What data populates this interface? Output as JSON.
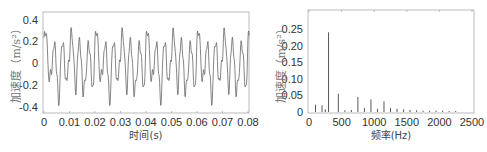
{
  "chart_data": [
    {
      "type": "line",
      "title": "",
      "xlabel": "时间(s)",
      "ylabel": "加速度（m/s²）",
      "xlim": [
        0,
        0.08
      ],
      "ylim": [
        -0.45,
        0.45
      ],
      "xticks": [
        "0",
        "0.01",
        "0.02",
        "0.03",
        "0.04",
        "0.05",
        "0.06",
        "0.07",
        "0.08"
      ],
      "yticks": [
        "0.4",
        "0.2",
        "0",
        "-0.2",
        "-0.4"
      ],
      "grid": false,
      "legend": null,
      "series": [
        {
          "name": "acceleration time signal",
          "description": "periodic multi-tone vibration signal, dominant ~300 Hz with harmonics; amplitude approx -0.37 to 0.36",
          "components_hz": [
            100,
            300,
            450,
            750
          ],
          "amplitudes": [
            0.03,
            0.24,
            0.055,
            0.045
          ]
        }
      ]
    },
    {
      "type": "bar",
      "title": "",
      "xlabel": "频率(Hz)",
      "ylabel": "加速度（m/s²）",
      "xlim": [
        0,
        2550
      ],
      "ylim": [
        0,
        0.3
      ],
      "xticks": [
        "0",
        "500",
        "1000",
        "1500",
        "2000",
        "2500"
      ],
      "yticks": [
        "0.25",
        "0.20",
        "0.15",
        "0.10",
        "0.05",
        "0"
      ],
      "grid": false,
      "legend": null,
      "x": [
        100,
        200,
        250,
        300,
        450,
        550,
        650,
        750,
        850,
        950,
        1050,
        1150,
        1250,
        1350,
        1450,
        1550,
        1650,
        1750,
        1850,
        1950,
        2050,
        2150,
        2250
      ],
      "values": [
        0.022,
        0.02,
        0.008,
        0.24,
        0.055,
        0.005,
        0.006,
        0.045,
        0.012,
        0.038,
        0.01,
        0.032,
        0.012,
        0.01,
        0.008,
        0.006,
        0.005,
        0.004,
        0.004,
        0.004,
        0.004,
        0.003,
        0.003
      ]
    }
  ]
}
